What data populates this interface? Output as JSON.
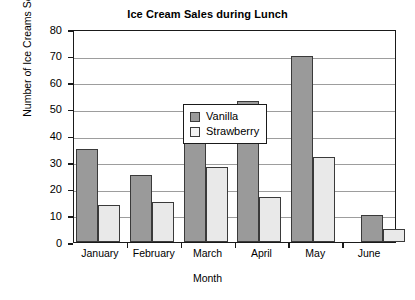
{
  "chart_data": {
    "type": "bar",
    "title": "Ice Cream Sales during Lunch",
    "xlabel": "Month",
    "ylabel": "Number of Ice Creams Sold",
    "categories": [
      "January",
      "February",
      "March",
      "April",
      "May",
      "June"
    ],
    "series": [
      {
        "name": "Vanilla",
        "color": "#9a9a9a",
        "values": [
          35,
          25,
          41,
          53,
          70,
          10
        ]
      },
      {
        "name": "Strawberry",
        "color": "#e9e9e9",
        "values": [
          14,
          15,
          28,
          17,
          32,
          5
        ]
      }
    ],
    "ylim": [
      0,
      80
    ],
    "yticks": [
      0,
      10,
      20,
      30,
      40,
      50,
      60,
      70,
      80
    ],
    "ytick_labels": [
      "0",
      "10",
      "20",
      "30",
      "40",
      "50",
      "60",
      "70",
      "80"
    ],
    "grid": true,
    "grid_axis": "y",
    "legend_position": "upper-left-inside"
  }
}
